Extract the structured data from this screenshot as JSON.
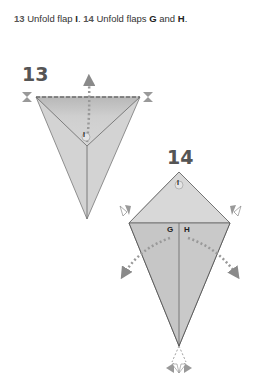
{
  "caption": {
    "step13_num": "13",
    "step13_text": " Unfold flap ",
    "step13_flap": "I",
    "sep": ". ",
    "step14_num": "14",
    "step14_text": " Unfold flaps ",
    "step14_flap_g": "G",
    "and": " and ",
    "step14_flap_h": "H",
    "end": "."
  },
  "diagram13": {
    "step_number": "13",
    "flap_label": "I"
  },
  "diagram14": {
    "step_number": "14",
    "flap_label_top": "I",
    "flap_label_g": "G",
    "flap_label_h": "H"
  },
  "colors": {
    "paper_light": "#d4d4d4",
    "paper_dark": "#bcbcbc",
    "arrow": "#8a8a8a",
    "line": "#666666"
  }
}
